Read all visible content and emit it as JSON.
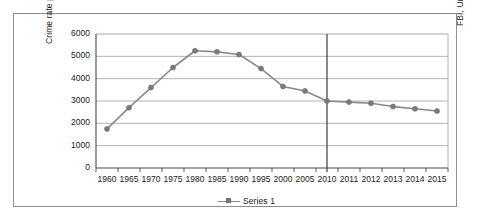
{
  "figure": {
    "source_caption": "FBI, Uniform Crime Reports",
    "legend_label": "Series 1"
  },
  "chart_data": {
    "type": "line",
    "title": "",
    "xlabel": "",
    "ylabel": "Crime rate per 100,000 population",
    "categories": [
      "1960",
      "1965",
      "1970",
      "1975",
      "1980",
      "1985",
      "1990",
      "1995",
      "2000",
      "2005",
      "2010",
      "2011",
      "2012",
      "2013",
      "2014",
      "2015"
    ],
    "series": [
      {
        "name": "Series 1",
        "values": [
          1750,
          2700,
          3600,
          4500,
          5250,
          5200,
          5080,
          4450,
          3650,
          3450,
          3000,
          2950,
          2900,
          2750,
          2650,
          2550
        ]
      }
    ],
    "ylim": [
      0,
      6000
    ],
    "ytick_labels": [
      "0",
      "1000",
      "2000",
      "3000",
      "4000",
      "5000",
      "6000"
    ],
    "ytick_values": [
      0,
      1000,
      2000,
      3000,
      4000,
      5000,
      6000
    ],
    "grid": true,
    "legend_position": "bottom",
    "annotations": [
      {
        "type": "vertical-line",
        "at_category": "2010"
      }
    ],
    "colors": {
      "line": "#8a8a8a",
      "marker": "#7a7a7a",
      "gridline": "#a9a9a9",
      "axis": "#4a4a4a",
      "divider": "#3c3c3c"
    }
  }
}
